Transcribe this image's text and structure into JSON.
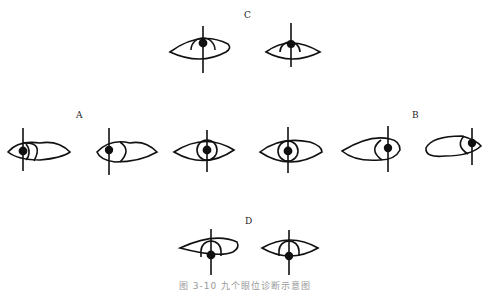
{
  "diagram": {
    "labels": {
      "C": "C",
      "A": "A",
      "B": "B",
      "D": "D"
    },
    "caption": "图 3-10  九个眼位诊断示意图",
    "groups": [
      {
        "name": "C",
        "description": "upward gaze",
        "count": 2
      },
      {
        "name": "A",
        "description": "left gaze series",
        "count": 3
      },
      {
        "name": "B",
        "description": "right gaze series",
        "count": 3
      },
      {
        "name": "D",
        "description": "downward gaze",
        "count": 2
      }
    ]
  }
}
